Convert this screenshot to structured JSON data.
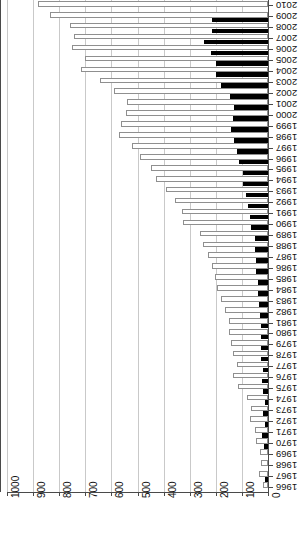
{
  "chart_data": {
    "type": "bar",
    "orientation": "horizontal-rotated",
    "title": "",
    "subtitle": "",
    "xlabel": "",
    "ylabel": "",
    "xlim": [
      1000,
      0
    ],
    "xticks": [
      1000,
      900,
      800,
      700,
      600,
      500,
      400,
      300,
      200,
      100,
      0
    ],
    "xtick_labels": [
      "1000",
      "900",
      "800",
      "700",
      "600",
      "500",
      "400",
      "300",
      "200",
      "100",
      "0"
    ],
    "x_axis_reversed": true,
    "grid": true,
    "grid_axis": "x",
    "legend": "none",
    "legend_position": "none",
    "categories": [
      "2010",
      "2009",
      "2008",
      "2007",
      "2006",
      "2005",
      "2004",
      "2003",
      "2002",
      "2001",
      "2000",
      "1999",
      "1998",
      "1997",
      "1996",
      "1995",
      "1994",
      "1993",
      "1992",
      "1991",
      "1990",
      "1989",
      "1988",
      "1987",
      "1986",
      "1985",
      "1984",
      "1983",
      "1982",
      "1981",
      "1980",
      "1979",
      "1978",
      "1977",
      "1976",
      "1975",
      "1974",
      "1973",
      "1972",
      "1971",
      "1970",
      "1969",
      "1968",
      "1967",
      "1966"
    ],
    "series": [
      {
        "name": "total",
        "style": "white-outlined",
        "color": "#ffffff",
        "edge_color": "#8f8f8f",
        "values": [
          880,
          835,
          760,
          745,
          750,
          700,
          715,
          645,
          590,
          540,
          545,
          565,
          570,
          520,
          490,
          450,
          430,
          390,
          355,
          330,
          325,
          260,
          250,
          230,
          215,
          205,
          195,
          180,
          165,
          150,
          150,
          140,
          135,
          120,
          135,
          115,
          80,
          65,
          70,
          50,
          45,
          30,
          28,
          35,
          20
        ]
      },
      {
        "name": "subset",
        "style": "solid-black",
        "color": "#000000",
        "values": [
          0,
          215,
          215,
          245,
          220,
          200,
          200,
          180,
          145,
          130,
          135,
          140,
          130,
          120,
          110,
          95,
          95,
          85,
          75,
          70,
          65,
          50,
          50,
          45,
          45,
          40,
          40,
          35,
          30,
          28,
          28,
          25,
          25,
          20,
          22,
          18,
          12,
          18,
          10,
          22,
          14,
          0,
          0,
          12,
          0
        ]
      }
    ]
  },
  "axes": {
    "x_axis_name": "value-axis",
    "y_axis_name": "year-axis"
  }
}
